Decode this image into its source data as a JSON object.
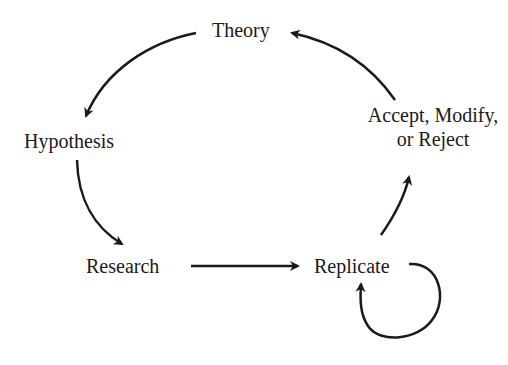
{
  "diagram": {
    "type": "cycle",
    "nodes": {
      "theory": {
        "label": "Theory"
      },
      "hypothesis": {
        "label": "Hypothesis"
      },
      "research": {
        "label": "Research"
      },
      "replicate": {
        "label": "Replicate"
      },
      "decision": {
        "line1": "Accept, Modify,",
        "line2": "or Reject"
      }
    },
    "edges": [
      {
        "from": "Theory",
        "to": "Hypothesis"
      },
      {
        "from": "Hypothesis",
        "to": "Research"
      },
      {
        "from": "Research",
        "to": "Replicate"
      },
      {
        "from": "Replicate",
        "to": "Replicate"
      },
      {
        "from": "Replicate",
        "to": "Accept, Modify, or Reject"
      },
      {
        "from": "Accept, Modify, or Reject",
        "to": "Theory"
      }
    ],
    "colors": {
      "ink": "#1a1a1a",
      "background": "#ffffff"
    }
  }
}
